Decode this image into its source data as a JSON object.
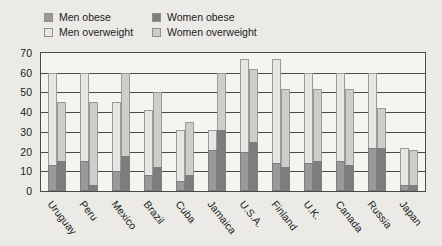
{
  "chart_data": {
    "type": "bar",
    "title": "",
    "xlabel": "",
    "ylabel": "",
    "ylim": [
      0,
      70
    ],
    "ytick_step": 10,
    "yticks": [
      0,
      10,
      20,
      30,
      40,
      50,
      60,
      70
    ],
    "grid": true,
    "legend_position": "top-left",
    "categories": [
      "Uruguay",
      "Peru",
      "Mexico",
      "Brazil",
      "Cuba",
      "Jamaica",
      "U.S.A.",
      "Finland",
      "U.K.",
      "Canada",
      "Russia",
      "Japan"
    ],
    "series": [
      {
        "name": "Men overweight",
        "color": "#e8e6e2",
        "values": [
          60,
          60,
          45,
          41,
          31,
          31,
          67,
          67,
          60,
          60,
          60,
          22
        ]
      },
      {
        "name": "Men obese",
        "color": "#9a9a9a",
        "values": [
          13,
          15,
          10,
          8,
          5,
          21,
          20,
          14,
          14,
          15,
          22,
          3
        ]
      },
      {
        "name": "Women overweight",
        "color": "#cfcdc9",
        "values": [
          45,
          45,
          60,
          50,
          35,
          60,
          62,
          52,
          52,
          52,
          42,
          21
        ]
      },
      {
        "name": "Women obese",
        "color": "#7d7d7d",
        "values": [
          15,
          3,
          18,
          12,
          8,
          31,
          25,
          12,
          15,
          13,
          22,
          3
        ]
      }
    ]
  },
  "legend": {
    "entries": [
      {
        "label": "Men obese",
        "swatch": "#9a9a9a"
      },
      {
        "label": "Women obese",
        "swatch": "#7d7d7d"
      },
      {
        "label": "Men overweight",
        "swatch": "#e8e6e2"
      },
      {
        "label": "Women overweight",
        "swatch": "#cfcdc9"
      }
    ]
  }
}
